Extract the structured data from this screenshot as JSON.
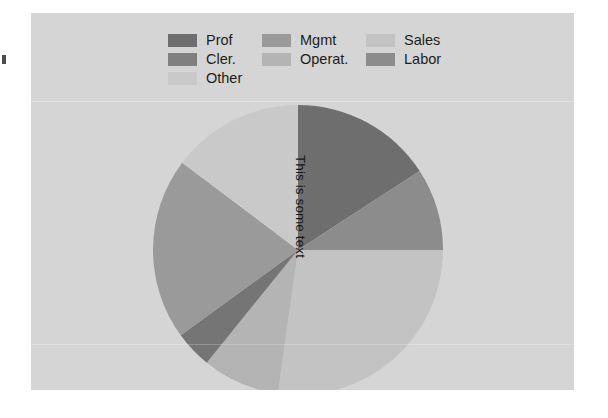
{
  "page": {
    "background": "#ffffff",
    "canvas_background": "#d5d5d5"
  },
  "legend": {
    "position": "top",
    "columns": 3,
    "items": [
      {
        "label": "Prof",
        "color": "#6e6e6e",
        "column": 1,
        "row": 1
      },
      {
        "label": "Mgmt",
        "color": "#9a9a9a",
        "column": 2,
        "row": 1
      },
      {
        "label": "Sales",
        "color": "#c3c3c3",
        "column": 3,
        "row": 1
      },
      {
        "label": "Cler.",
        "color": "#808080",
        "column": 1,
        "row": 2
      },
      {
        "label": "Operat.",
        "color": "#b4b4b4",
        "column": 2,
        "row": 2
      },
      {
        "label": "Labor",
        "color": "#8c8c8c",
        "column": 3,
        "row": 2
      },
      {
        "label": "Other",
        "color": "#c9c9c9",
        "column": 1,
        "row": 3
      }
    ]
  },
  "annotation": {
    "text": "This is some text",
    "rotation_deg": 90
  },
  "chart_data": {
    "type": "pie",
    "title": "",
    "legend_position": "top",
    "start_angle_deg": 0,
    "direction": "clockwise",
    "center": {
      "x": 298,
      "y": 250
    },
    "radius": 145,
    "labels": [
      "Prof",
      "Cler.",
      "Sales",
      "Operat.",
      "Labor",
      "Mgmt",
      "Other"
    ],
    "values": [
      15.8,
      9.2,
      27.2,
      8.6,
      4.2,
      20.3,
      14.7
    ],
    "angles_deg": [
      57,
      33,
      98,
      31,
      15,
      73,
      53
    ],
    "colors": [
      "#6e6e6e",
      "#8c8c8c",
      "#c3c3c3",
      "#b4b4b4",
      "#757575",
      "#9a9a9a",
      "#c9c9c9"
    ],
    "slices": [
      {
        "label": "Prof",
        "value": 15.8,
        "angle_deg": 57,
        "start_deg": 0,
        "end_deg": 57,
        "color": "#6e6e6e"
      },
      {
        "label": "Cler.",
        "value": 9.2,
        "angle_deg": 33,
        "start_deg": 57,
        "end_deg": 90,
        "color": "#8c8c8c"
      },
      {
        "label": "Sales",
        "value": 27.2,
        "angle_deg": 98,
        "start_deg": 90,
        "end_deg": 188,
        "color": "#c3c3c3"
      },
      {
        "label": "Operat.",
        "value": 8.6,
        "angle_deg": 31,
        "start_deg": 188,
        "end_deg": 219,
        "color": "#b4b4b4"
      },
      {
        "label": "Labor",
        "value": 4.2,
        "angle_deg": 15,
        "start_deg": 219,
        "end_deg": 234,
        "color": "#757575"
      },
      {
        "label": "Mgmt",
        "value": 20.3,
        "angle_deg": 73,
        "start_deg": 234,
        "end_deg": 307,
        "color": "#9a9a9a"
      },
      {
        "label": "Other",
        "value": 14.7,
        "angle_deg": 53,
        "start_deg": 307,
        "end_deg": 360,
        "color": "#c9c9c9"
      }
    ]
  }
}
